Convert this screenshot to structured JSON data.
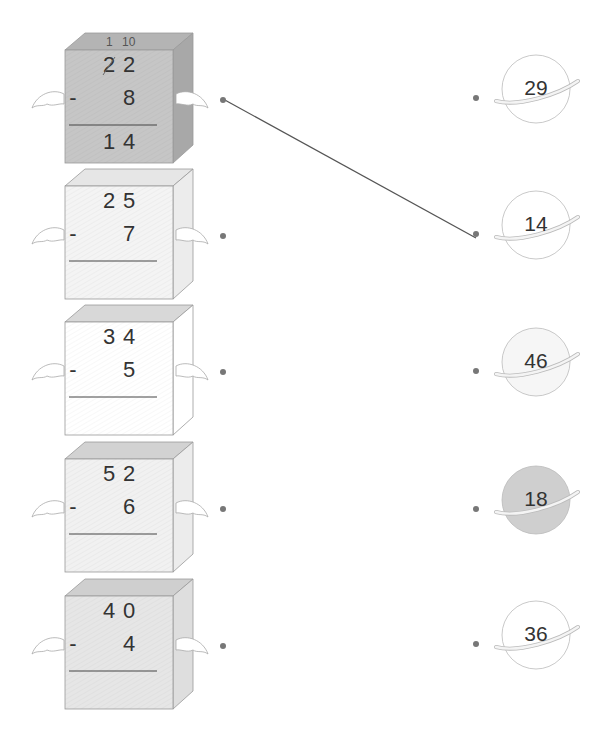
{
  "problems": [
    {
      "top": [
        "2",
        "2"
      ],
      "bottom": "8",
      "answer": [
        "1",
        "4"
      ],
      "carry": [
        "1",
        "10"
      ],
      "shade": "#c6c6c6",
      "topShade": "#b4b4b4",
      "sideShade": "#a8a8a8",
      "worked": true
    },
    {
      "top": [
        "2",
        "5"
      ],
      "bottom": "7",
      "answer": [
        "",
        ""
      ],
      "carry": null,
      "shade": "#f4f4f4",
      "topShade": "#e6e6e6",
      "sideShade": "#ececec",
      "worked": false
    },
    {
      "top": [
        "3",
        "4"
      ],
      "bottom": "5",
      "answer": [
        "",
        ""
      ],
      "carry": null,
      "shade": "#ffffff",
      "topShade": "#d8d8d8",
      "sideShade": "#ffffff",
      "worked": false
    },
    {
      "top": [
        "5",
        "2"
      ],
      "bottom": "6",
      "answer": [
        "",
        ""
      ],
      "carry": null,
      "shade": "#f1f1f1",
      "topShade": "#d2d2d2",
      "sideShade": "#ececec",
      "worked": false
    },
    {
      "top": [
        "4",
        "0"
      ],
      "bottom": "4",
      "answer": [
        "",
        ""
      ],
      "carry": null,
      "shade": "#e6e6e6",
      "topShade": "#cfcfcf",
      "sideShade": "#dedede",
      "worked": false
    }
  ],
  "minus_sign": "-",
  "answers": [
    {
      "value": "29",
      "fill": "#ffffff"
    },
    {
      "value": "14",
      "fill": "#ffffff"
    },
    {
      "value": "46",
      "fill": "#f6f6f6"
    },
    {
      "value": "18",
      "fill": "#cfcfcf"
    },
    {
      "value": "36",
      "fill": "#ffffff"
    }
  ],
  "connection": {
    "from_problem": 0,
    "to_answer": 1,
    "color": "#555555"
  }
}
